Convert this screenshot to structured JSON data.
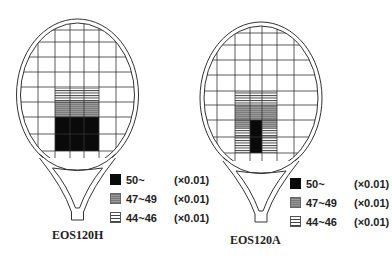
{
  "colors": {
    "line": "#333333",
    "black": "#0a0a0a",
    "gray": "#8e8e8e",
    "stripe": "#444444",
    "bg": "#ffffff"
  },
  "rackets": [
    {
      "name": "EOS120H",
      "frame": {
        "cx": 77.5,
        "cy": 95,
        "rx": 61,
        "ry": 76,
        "top": 19
      },
      "handle": {
        "cx": 77.5,
        "throat_y": 168,
        "bottom_y": 220
      },
      "v_lines": [
        38,
        55,
        70,
        84,
        99,
        116
      ],
      "h_lines": [
        30,
        42,
        57,
        72,
        87,
        102,
        117,
        134,
        151,
        166
      ],
      "regions": [
        {
          "level": "44~46",
          "fill": "stripe",
          "x": 55,
          "y": 88,
          "w": 44,
          "h": 14
        },
        {
          "level": "47~49",
          "fill": "gray",
          "x": 55,
          "y": 102,
          "w": 44,
          "h": 15
        },
        {
          "level": "50~",
          "fill": "black",
          "x": 55,
          "y": 117,
          "w": 44,
          "h": 34
        }
      ],
      "legend": {
        "x": 110,
        "y": 170
      },
      "caption": {
        "text": "EOS120H",
        "x": 80,
        "y": 238
      }
    },
    {
      "name": "EOS120A",
      "frame": {
        "cx": 261,
        "cy": 98,
        "rx": 61,
        "ry": 76,
        "top": 22
      },
      "handle": {
        "cx": 261,
        "throat_y": 171,
        "bottom_y": 222
      },
      "v_lines": [
        217,
        235,
        250,
        262,
        277,
        294
      ],
      "h_lines": [
        33,
        45,
        60,
        75,
        91,
        105,
        120,
        137,
        153,
        168
      ],
      "regions": [
        {
          "level": "44~46",
          "fill": "stripe",
          "x": 235,
          "y": 91,
          "w": 42,
          "h": 14
        },
        {
          "level": "47~49",
          "fill": "gray",
          "x": 235,
          "y": 105,
          "w": 42,
          "h": 24
        },
        {
          "level": "44~46",
          "fill": "stripe",
          "x": 235,
          "y": 129,
          "w": 42,
          "h": 24
        },
        {
          "level": "50~",
          "fill": "black",
          "x": 250,
          "y": 120,
          "w": 12,
          "h": 33
        }
      ],
      "legend": {
        "x": 290,
        "y": 174
      },
      "caption": {
        "text": "EOS120A",
        "x": 258,
        "y": 243
      }
    }
  ],
  "legend_items": [
    {
      "swatch": "black",
      "range": "50~",
      "multiplier": "(×0.01)"
    },
    {
      "swatch": "gray",
      "range": "47~49",
      "multiplier": "(×0.01)"
    },
    {
      "swatch": "stripe",
      "range": "44~46",
      "multiplier": "(×0.01)"
    }
  ]
}
